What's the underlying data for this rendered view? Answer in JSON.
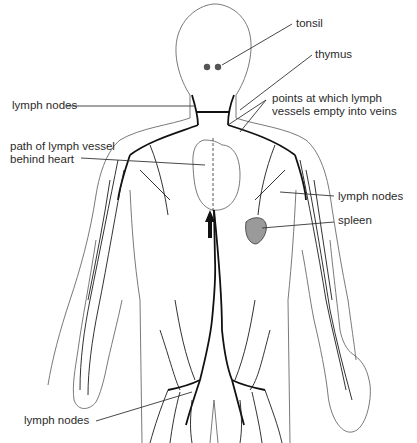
{
  "diagram": {
    "labels": {
      "tonsil": "tonsil",
      "thymus": "thymus",
      "lymph_nodes_neck": "lymph nodes",
      "points_line1": "points at which lymph",
      "points_line2": "vessels empty into veins",
      "path_line1": "path of lymph vessel",
      "path_line2": "behind heart",
      "lymph_nodes_armpit": "lymph nodes",
      "spleen": "spleen",
      "lymph_nodes_groin": "lymph nodes"
    },
    "colors": {
      "outline": "#6a6a6a",
      "vessel": "#1c1c1c",
      "spleen_fill": "#9a9a9a",
      "text": "#2b2b2b"
    }
  }
}
